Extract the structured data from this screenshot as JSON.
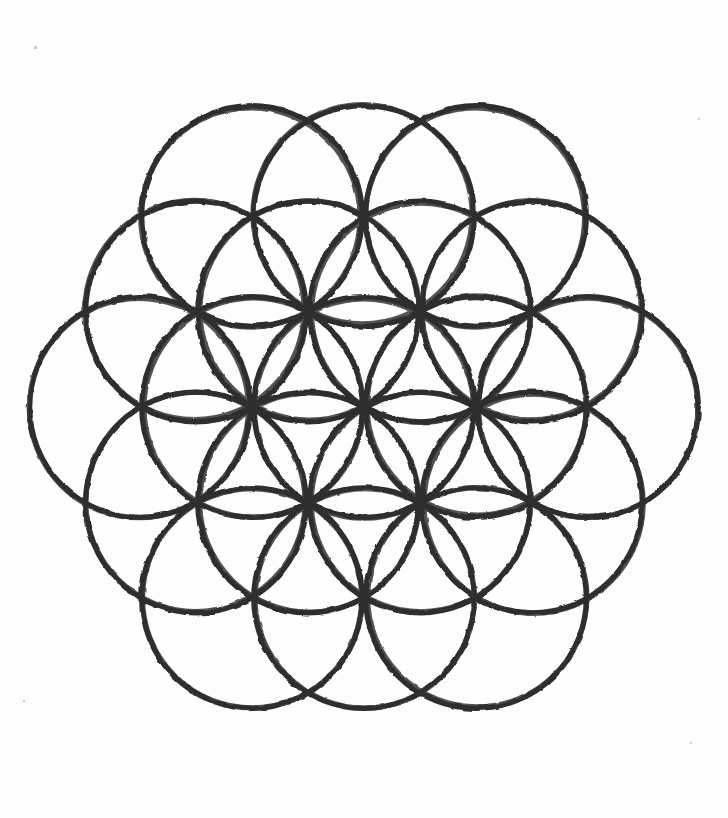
{
  "image": {
    "title": "Flower of Life",
    "subject": "flower-of-life-sacred-geometry",
    "medium": "hand-drawn ink on paper",
    "background_color": "#fefefe",
    "stroke_color": "#2e2e2e",
    "stroke_width_px": 5.2,
    "canvas": {
      "width": 728,
      "height": 818
    }
  },
  "geometry": {
    "pattern_name": "Flower of Life",
    "circle_count": 19,
    "lattice": "hexagonal",
    "center": {
      "x": 364,
      "y": 407
    },
    "circle_radius_px": 112,
    "vertical_scale": 0.985,
    "ring_counts": [
      1,
      6,
      12
    ],
    "hex_axial_coordinates": [
      {
        "q": 0,
        "r": 0
      },
      {
        "q": 1,
        "r": 0
      },
      {
        "q": 1,
        "r": -1
      },
      {
        "q": 0,
        "r": -1
      },
      {
        "q": -1,
        "r": 0
      },
      {
        "q": -1,
        "r": 1
      },
      {
        "q": 0,
        "r": 1
      },
      {
        "q": 2,
        "r": 0
      },
      {
        "q": 2,
        "r": -1
      },
      {
        "q": 2,
        "r": -2
      },
      {
        "q": 1,
        "r": -2
      },
      {
        "q": 0,
        "r": -2
      },
      {
        "q": -1,
        "r": -1
      },
      {
        "q": -2,
        "r": 0
      },
      {
        "q": -2,
        "r": 1
      },
      {
        "q": -2,
        "r": 2
      },
      {
        "q": -1,
        "r": 2
      },
      {
        "q": 0,
        "r": 2
      },
      {
        "q": 1,
        "r": 1
      }
    ],
    "bounding_box": {
      "left": 43,
      "top": 48,
      "right": 686,
      "bottom": 766
    }
  },
  "specks": [
    {
      "x": 34,
      "y": 46,
      "size": 3
    },
    {
      "x": 698,
      "y": 118,
      "size": 2
    },
    {
      "x": 690,
      "y": 742,
      "size": 2
    },
    {
      "x": 23,
      "y": 700,
      "size": 2
    }
  ]
}
